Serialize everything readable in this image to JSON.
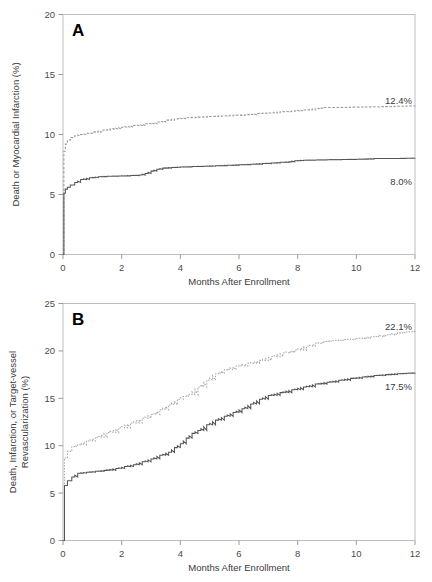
{
  "figure": {
    "panels": [
      "A",
      "B"
    ]
  },
  "panel_a": {
    "letter": "A",
    "ylabel": "Death or Myocardial Infarction (%)",
    "xlabel": "Months After Enrollment",
    "yticks": [
      "0",
      "5",
      "10",
      "15",
      "20"
    ],
    "xticks": [
      "0",
      "2",
      "4",
      "6",
      "8",
      "10",
      "12"
    ],
    "label_upper": "12.4%",
    "label_lower": "8.0%"
  },
  "panel_b": {
    "letter": "B",
    "ylabel_line1": "Death, Infarction, or Target-vessel",
    "ylabel_line2": "Revascularization (%)",
    "xlabel": "Months After Enrollment",
    "yticks": [
      "0",
      "5",
      "10",
      "15",
      "20",
      "25"
    ],
    "xticks": [
      "0",
      "2",
      "4",
      "6",
      "8",
      "10",
      "12"
    ],
    "label_upper": "22.1%",
    "label_lower": "17.5%"
  },
  "chart_data": [
    {
      "type": "line",
      "id": "panel-a",
      "title": "A",
      "xlabel": "Months After Enrollment",
      "ylabel": "Death or Myocardial Infarction (%)",
      "xlim": [
        0,
        12
      ],
      "ylim": [
        0,
        20
      ],
      "xticks": [
        0,
        2,
        4,
        6,
        8,
        10,
        12
      ],
      "yticks": [
        0,
        5,
        10,
        15,
        20
      ],
      "grid": false,
      "legend": "none",
      "step": true,
      "annotations": [
        {
          "text": "12.4%",
          "x": 11.6,
          "y": 13.6,
          "series": "dashed-upper"
        },
        {
          "text": "8.0%",
          "x": 11.6,
          "y": 6.8,
          "series": "solid-lower"
        }
      ],
      "series": [
        {
          "name": "dashed-upper",
          "style": "dashed",
          "color": "#9a9a9a",
          "endpoint_value": 12.4,
          "x": [
            0,
            0.03,
            0.08,
            0.15,
            0.25,
            0.4,
            0.6,
            0.8,
            1.0,
            1.3,
            1.6,
            2.0,
            2.4,
            2.8,
            3.2,
            3.5,
            3.8,
            4.2,
            4.6,
            5.0,
            5.4,
            5.8,
            6.2,
            6.6,
            7.0,
            7.4,
            7.8,
            8.2,
            8.6,
            8.9,
            9.3,
            9.8,
            10.3,
            10.8,
            11.3,
            11.7,
            12.0
          ],
          "values": [
            0,
            8.6,
            9.2,
            9.55,
            9.75,
            9.9,
            10.0,
            10.1,
            10.2,
            10.35,
            10.45,
            10.6,
            10.75,
            10.9,
            11.05,
            11.2,
            11.3,
            11.4,
            11.45,
            11.5,
            11.55,
            11.6,
            11.65,
            11.75,
            11.8,
            11.9,
            11.95,
            12.05,
            12.15,
            12.25,
            12.25,
            12.28,
            12.3,
            12.32,
            12.35,
            12.38,
            12.4
          ]
        },
        {
          "name": "solid-lower",
          "style": "solid",
          "color": "#555555",
          "endpoint_value": 8.0,
          "x": [
            0,
            0.03,
            0.08,
            0.15,
            0.25,
            0.4,
            0.6,
            0.9,
            1.2,
            1.5,
            1.9,
            2.3,
            2.6,
            2.8,
            3.0,
            3.2,
            3.4,
            3.7,
            4.0,
            4.4,
            4.8,
            5.2,
            5.6,
            6.0,
            6.4,
            6.8,
            7.1,
            7.4,
            7.7,
            7.9,
            8.2,
            8.6,
            9.0,
            9.5,
            10.0,
            10.6,
            10.9,
            11.3,
            11.7,
            12.0
          ],
          "values": [
            0,
            5.1,
            5.45,
            5.6,
            5.8,
            6.0,
            6.25,
            6.4,
            6.48,
            6.52,
            6.55,
            6.58,
            6.62,
            6.75,
            6.95,
            7.1,
            7.2,
            7.25,
            7.3,
            7.33,
            7.36,
            7.4,
            7.43,
            7.48,
            7.52,
            7.58,
            7.62,
            7.68,
            7.72,
            7.82,
            7.86,
            7.88,
            7.9,
            7.92,
            7.94,
            8.0,
            8.0,
            8.0,
            8.02,
            8.04
          ]
        }
      ]
    },
    {
      "type": "line",
      "id": "panel-b",
      "title": "B",
      "xlabel": "Months After Enrollment",
      "ylabel": "Death, Infarction, or Target-vessel Revascularization (%)",
      "xlim": [
        0,
        12
      ],
      "ylim": [
        0,
        25
      ],
      "xticks": [
        0,
        2,
        4,
        6,
        8,
        10,
        12
      ],
      "yticks": [
        0,
        5,
        10,
        15,
        20,
        25
      ],
      "grid": false,
      "legend": "none",
      "step": true,
      "annotations": [
        {
          "text": "22.1%",
          "x": 11.6,
          "y": 23.3,
          "series": "dotted-upper"
        },
        {
          "text": "17.5%",
          "x": 11.6,
          "y": 16.2,
          "series": "solid-lower"
        }
      ],
      "series": [
        {
          "name": "dotted-upper",
          "style": "dotted",
          "color": "#a8a8a8",
          "endpoint_value": 22.1,
          "x": [
            0,
            0.05,
            0.15,
            0.3,
            0.5,
            0.8,
            1.1,
            1.5,
            1.9,
            2.3,
            2.7,
            3.0,
            3.3,
            3.6,
            3.9,
            4.1,
            4.3,
            4.6,
            4.9,
            5.2,
            5.5,
            5.9,
            6.3,
            6.7,
            7.1,
            7.5,
            7.9,
            8.3,
            8.6,
            8.9,
            9.2,
            9.6,
            10.0,
            10.5,
            11.0,
            11.4,
            11.7,
            11.9,
            12.0
          ],
          "values": [
            0,
            8.7,
            9.4,
            9.9,
            10.1,
            10.5,
            10.9,
            11.4,
            11.9,
            12.4,
            12.9,
            13.3,
            13.8,
            14.3,
            14.9,
            15.2,
            15.4,
            16.2,
            16.9,
            17.6,
            18.0,
            18.4,
            18.7,
            19.0,
            19.4,
            19.8,
            20.1,
            20.5,
            20.8,
            21.0,
            21.1,
            21.2,
            21.3,
            21.5,
            21.7,
            21.9,
            22.0,
            22.05,
            22.1
          ]
        },
        {
          "name": "solid-lower",
          "style": "solid",
          "color": "#555555",
          "endpoint_value": 17.5,
          "x": [
            0,
            0.05,
            0.15,
            0.3,
            0.5,
            0.8,
            1.1,
            1.4,
            1.8,
            2.1,
            2.4,
            2.7,
            3.0,
            3.3,
            3.6,
            3.8,
            4.0,
            4.2,
            4.4,
            4.6,
            4.9,
            5.2,
            5.5,
            5.8,
            6.1,
            6.4,
            6.7,
            7.0,
            7.4,
            7.8,
            8.2,
            8.6,
            9.0,
            9.4,
            9.8,
            10.2,
            10.6,
            11.0,
            11.4,
            11.7,
            12.0
          ],
          "values": [
            0,
            5.8,
            6.3,
            6.7,
            7.1,
            7.2,
            7.3,
            7.4,
            7.6,
            7.8,
            8.0,
            8.3,
            8.6,
            9.0,
            9.3,
            9.8,
            10.2,
            10.8,
            11.3,
            11.6,
            12.2,
            12.7,
            13.1,
            13.5,
            13.9,
            14.4,
            14.9,
            15.3,
            15.6,
            15.9,
            16.2,
            16.5,
            16.7,
            16.9,
            17.1,
            17.25,
            17.4,
            17.5,
            17.6,
            17.65,
            17.7
          ]
        }
      ]
    }
  ]
}
